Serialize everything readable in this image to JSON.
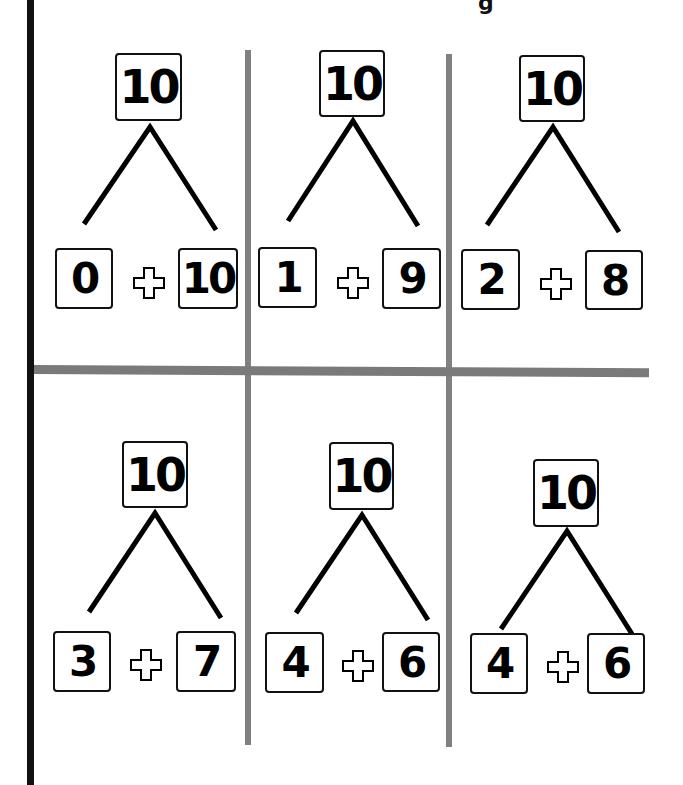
{
  "page": {
    "title_fragment": "g",
    "colors": {
      "border": "#111111",
      "grid_line": "#7a7a7a",
      "background": "#ffffff"
    }
  },
  "number_bonds": [
    {
      "whole": "10",
      "part_a": "0",
      "operator_icon": "plus-icon",
      "part_b": "10"
    },
    {
      "whole": "10",
      "part_a": "1",
      "operator_icon": "plus-icon",
      "part_b": "9"
    },
    {
      "whole": "10",
      "part_a": "2",
      "operator_icon": "plus-icon",
      "part_b": "8"
    },
    {
      "whole": "10",
      "part_a": "3",
      "operator_icon": "plus-icon",
      "part_b": "7"
    },
    {
      "whole": "10",
      "part_a": "4",
      "operator_icon": "plus-icon",
      "part_b": "6"
    },
    {
      "whole": "10",
      "part_a": "4",
      "operator_icon": "plus-icon",
      "part_b": "6"
    }
  ]
}
